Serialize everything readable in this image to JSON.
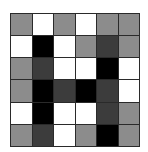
{
  "palette": {
    "W": "#ffffff",
    "L": "#8c8c8c",
    "D": "#3c3c3c",
    "B": "#000000"
  },
  "grid": {
    "rows": 6,
    "cols": 6,
    "cells": [
      [
        "L",
        "W",
        "L",
        "W",
        "L",
        "L"
      ],
      [
        "W",
        "B",
        "W",
        "L",
        "D",
        "L"
      ],
      [
        "L",
        "D",
        "W",
        "W",
        "B",
        "W"
      ],
      [
        "L",
        "B",
        "D",
        "B",
        "D",
        "W"
      ],
      [
        "W",
        "B",
        "W",
        "W",
        "D",
        "L"
      ],
      [
        "L",
        "D",
        "W",
        "L",
        "B",
        "L"
      ]
    ]
  }
}
